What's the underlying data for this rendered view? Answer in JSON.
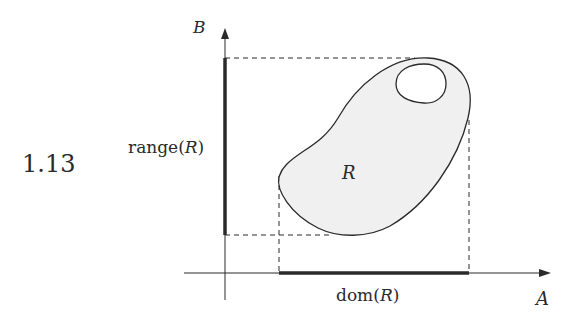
{
  "figure": {
    "exercise_number": "1.13",
    "axes": {
      "x_label": "A",
      "y_label": "B"
    },
    "region_label": "R",
    "range_label_prefix": "range(",
    "range_label_var": "R",
    "range_label_suffix": ")",
    "domain_label_prefix": "dom(",
    "domain_label_var": "R",
    "domain_label_suffix": ")",
    "colors": {
      "region_fill": "#f0f0f0",
      "stroke": "#2a2a2a"
    }
  }
}
